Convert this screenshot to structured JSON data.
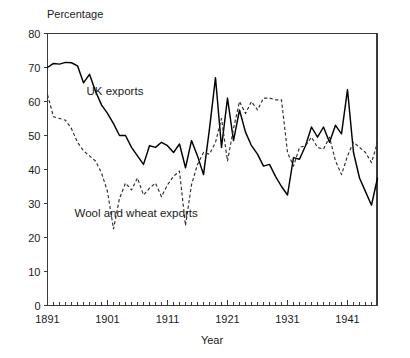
{
  "chart_data": {
    "type": "line",
    "title": "",
    "ylabel": "Percentage",
    "xlabel": "Year",
    "xlim": [
      1891,
      1946
    ],
    "ylim": [
      0,
      80
    ],
    "ytick_labels": [
      "0",
      "10",
      "20",
      "30",
      "40",
      "50",
      "60",
      "70",
      "80"
    ],
    "ytick_values": [
      0,
      10,
      20,
      30,
      40,
      50,
      60,
      70,
      80
    ],
    "xtick_labels": [
      "1891",
      "1901",
      "1911",
      "1921",
      "1931",
      "1941"
    ],
    "xtick_values": [
      1891,
      1901,
      1911,
      1921,
      1931,
      1941
    ],
    "minor_xticks_every": 1,
    "grid": false,
    "legend_position": "inline-annotations",
    "annotations": [
      {
        "text": "UK exports",
        "x": 1897.5,
        "y": 62
      },
      {
        "text": "Wool and wheat exports",
        "x": 1895.5,
        "y": 26
      }
    ],
    "x": [
      1891,
      1892,
      1893,
      1894,
      1895,
      1896,
      1897,
      1898,
      1899,
      1900,
      1901,
      1902,
      1903,
      1904,
      1905,
      1906,
      1907,
      1908,
      1909,
      1910,
      1911,
      1912,
      1913,
      1914,
      1915,
      1916,
      1917,
      1918,
      1919,
      1920,
      1921,
      1922,
      1923,
      1924,
      1925,
      1926,
      1927,
      1928,
      1929,
      1930,
      1931,
      1932,
      1933,
      1934,
      1935,
      1936,
      1937,
      1938,
      1939,
      1940,
      1941,
      1942,
      1943,
      1944,
      1945,
      1946
    ],
    "series": [
      {
        "name": "UK exports",
        "style": "solid",
        "color": "#000000",
        "values": [
          70.0,
          71.2,
          71.0,
          71.5,
          71.4,
          70.5,
          65.5,
          68.0,
          63.0,
          59.0,
          56.5,
          53.5,
          50.0,
          50.0,
          46.5,
          44.0,
          41.5,
          47.0,
          46.5,
          48.0,
          47.0,
          45.0,
          47.5,
          40.5,
          48.5,
          44.0,
          38.5,
          52.0,
          67.0,
          46.5,
          61.0,
          48.5,
          57.5,
          51.0,
          47.0,
          44.5,
          41.0,
          41.5,
          38.0,
          35.0,
          32.5,
          43.5,
          43.0,
          47.0,
          52.5,
          49.5,
          52.5,
          48.0,
          53.0,
          50.5,
          63.5,
          45.0,
          37.5,
          33.5,
          29.5,
          37.5
        ]
      },
      {
        "name": "Wool and wheat exports",
        "style": "dashed",
        "color": "#2b2b2b",
        "values": [
          62.0,
          55.5,
          55.0,
          54.5,
          52.0,
          48.0,
          45.5,
          44.0,
          42.5,
          39.0,
          33.5,
          22.5,
          31.5,
          36.0,
          34.0,
          37.5,
          32.5,
          34.5,
          36.0,
          32.0,
          35.5,
          38.0,
          39.5,
          23.5,
          35.5,
          41.5,
          45.0,
          44.5,
          48.0,
          55.0,
          42.5,
          52.0,
          60.0,
          56.5,
          60.0,
          57.5,
          61.0,
          61.0,
          60.5,
          60.5,
          45.0,
          41.0,
          46.5,
          47.0,
          49.5,
          46.5,
          46.0,
          49.5,
          42.5,
          38.5,
          44.0,
          48.0,
          46.5,
          45.0,
          42.0,
          48.0
        ]
      }
    ]
  }
}
